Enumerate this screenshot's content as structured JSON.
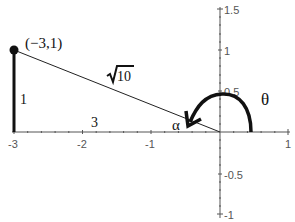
{
  "diagram": {
    "point_label": "(−3,1)",
    "hypotenuse_label": "10",
    "opposite_label": "1",
    "adjacent_label": "3",
    "reference_angle_label": "α",
    "angle_label": "θ",
    "x_ticks": [
      {
        "value": -3,
        "label": "-3"
      },
      {
        "value": -2,
        "label": "-2"
      },
      {
        "value": -1,
        "label": "-1"
      },
      {
        "value": 1,
        "label": "1"
      }
    ],
    "y_ticks": [
      {
        "value": 1.5,
        "label": "1.5"
      },
      {
        "value": 1,
        "label": "1"
      },
      {
        "value": 0.5,
        "label": "0.5"
      },
      {
        "value": -0.5,
        "label": "-0.5"
      },
      {
        "value": -1,
        "label": "-1"
      }
    ],
    "colors": {
      "axis": "#555555",
      "line": "#222222",
      "thick": "#111111"
    }
  }
}
